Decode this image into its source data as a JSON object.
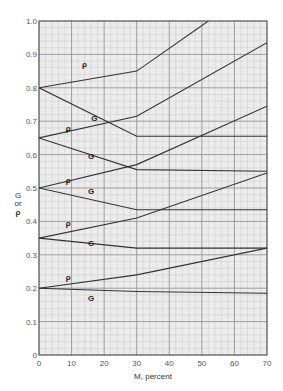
{
  "chart_data": {
    "type": "line",
    "title": "",
    "xlabel": "M, percent",
    "ylabel": "G or ρ",
    "ylabel_lines": [
      "G",
      "or",
      "ρ"
    ],
    "xlim": [
      0,
      70
    ],
    "ylim": [
      0,
      1.0
    ],
    "xticks": [
      0,
      10,
      20,
      30,
      40,
      50,
      60,
      70
    ],
    "xtick_labels": [
      "0",
      "10",
      "20",
      "30",
      "40",
      "50",
      "60",
      "70"
    ],
    "yticks": [
      0,
      0.1,
      0.2,
      0.3,
      0.4,
      0.5,
      0.6,
      0.7,
      0.8,
      0.9,
      1.0
    ],
    "ytick_labels": [
      "0",
      "0.1",
      "0.2",
      "0.3",
      "0.4",
      "0.5",
      "0.6",
      "0.7",
      "0.8",
      "0.9",
      "1.0"
    ],
    "grid": true,
    "grid_style": "graph paper (major every 10%/0.1, minor every 2%/0.02)",
    "legend": "inline labels near each curve",
    "series": [
      {
        "name": "ρ",
        "group": 1,
        "points": [
          [
            0,
            0.8
          ],
          [
            30,
            0.85
          ],
          [
            52,
            1.0
          ]
        ],
        "label_at": [
          14,
          0.87
        ]
      },
      {
        "name": "G",
        "group": 1,
        "points": [
          [
            0,
            0.8
          ],
          [
            30,
            0.655
          ],
          [
            70,
            0.655
          ]
        ],
        "label_at": [
          17,
          0.71
        ]
      },
      {
        "name": "ρ",
        "group": 2,
        "points": [
          [
            0,
            0.65
          ],
          [
            30,
            0.715
          ],
          [
            70,
            0.935
          ]
        ],
        "label_at": [
          9,
          0.68
        ]
      },
      {
        "name": "G",
        "group": 2,
        "points": [
          [
            0,
            0.65
          ],
          [
            30,
            0.555
          ],
          [
            70,
            0.55
          ]
        ],
        "label_at": [
          16,
          0.595
        ]
      },
      {
        "name": "ρ",
        "group": 3,
        "points": [
          [
            0,
            0.5
          ],
          [
            30,
            0.57
          ],
          [
            70,
            0.745
          ]
        ],
        "label_at": [
          9,
          0.525
        ]
      },
      {
        "name": "G",
        "group": 3,
        "points": [
          [
            0,
            0.5
          ],
          [
            30,
            0.435
          ],
          [
            70,
            0.435
          ]
        ],
        "label_at": [
          16,
          0.49
        ]
      },
      {
        "name": "ρ",
        "group": 4,
        "points": [
          [
            0,
            0.35
          ],
          [
            30,
            0.41
          ],
          [
            70,
            0.545
          ]
        ],
        "label_at": [
          9,
          0.395
        ]
      },
      {
        "name": "G",
        "group": 4,
        "points": [
          [
            0,
            0.35
          ],
          [
            30,
            0.32
          ],
          [
            70,
            0.32
          ]
        ],
        "label_at": [
          16,
          0.335
        ]
      },
      {
        "name": "ρ",
        "group": 5,
        "points": [
          [
            0,
            0.2
          ],
          [
            30,
            0.24
          ],
          [
            70,
            0.32
          ]
        ],
        "label_at": [
          9,
          0.235
        ]
      },
      {
        "name": "G",
        "group": 5,
        "points": [
          [
            0,
            0.2
          ],
          [
            30,
            0.19
          ],
          [
            70,
            0.185
          ]
        ],
        "label_at": [
          16,
          0.17
        ]
      }
    ]
  },
  "colors": {
    "background": "#ffffff",
    "plot_background": "#ececec",
    "minor_grid": "#c8c8c8",
    "major_grid": "#8a8a8a",
    "curve": "#333333",
    "frame": "#555555"
  }
}
